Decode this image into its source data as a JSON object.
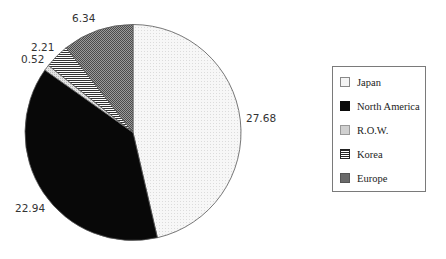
{
  "chart_data": {
    "type": "pie",
    "title": "",
    "start_angle_deg": 0,
    "direction": "clockwise",
    "categories": [
      "Japan",
      "North America",
      "R.O.W.",
      "Korea",
      "Europe"
    ],
    "values": [
      27.68,
      22.94,
      0.52,
      2.21,
      6.34
    ],
    "value_labels": [
      "27.68",
      "22.94",
      "0.52",
      "2.21",
      "6.34"
    ],
    "fills": [
      "dots-light",
      "solid-black",
      "light-gray",
      "horizontal-stripes",
      "dark-crosshatch"
    ],
    "colors": [
      "#f2f2f2",
      "#0a0a0a",
      "#d6d6d6",
      "#6e6e6e",
      "#7c7c7c"
    ],
    "legend": {
      "position": "right",
      "entries": [
        "Japan",
        "North America",
        "R.O.W.",
        "Korea",
        "Europe"
      ]
    },
    "grid": false
  },
  "legend": {
    "items": [
      {
        "label": "Japan"
      },
      {
        "label": "North America"
      },
      {
        "label": "R.O.W."
      },
      {
        "label": "Korea"
      },
      {
        "label": "Europe"
      }
    ]
  },
  "labels": {
    "japan": "27.68",
    "north_america": "22.94",
    "row": "0.52",
    "korea": "2.21",
    "europe": "6.34"
  }
}
